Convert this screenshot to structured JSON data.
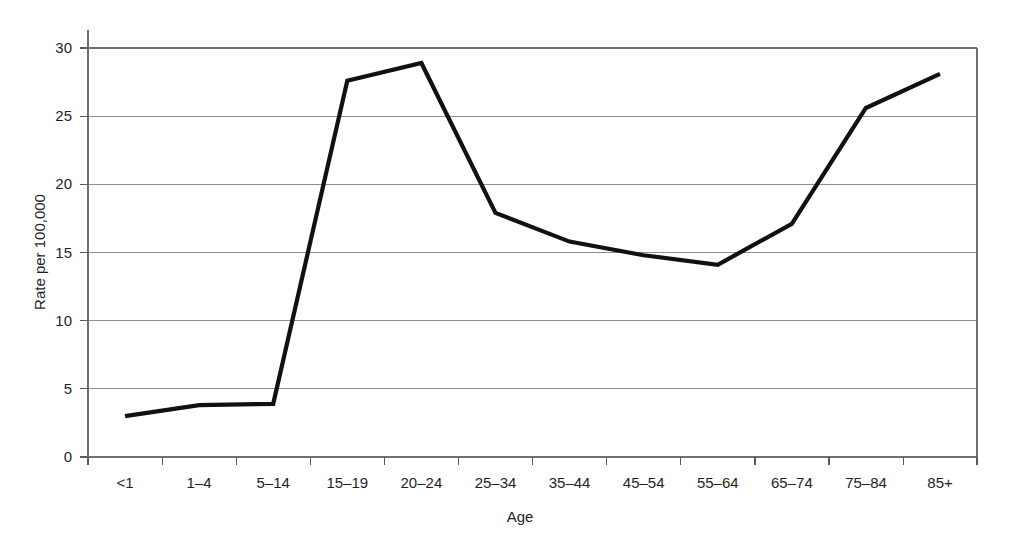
{
  "chart_data": {
    "type": "line",
    "title": "",
    "subtitle": "",
    "xlabel": "Age",
    "ylabel": "Rate per 100,000",
    "categories": [
      "<1",
      "1–4",
      "5–14",
      "15–19",
      "20–24",
      "25–34",
      "35–44",
      "45–54",
      "55–64",
      "65–74",
      "75–84",
      "85+"
    ],
    "values": [
      3.0,
      3.8,
      3.9,
      27.6,
      28.9,
      17.9,
      15.8,
      14.8,
      14.1,
      17.1,
      25.6,
      28.1
    ],
    "series": [
      {
        "name": "Rate per 100,000",
        "values": [
          3.0,
          3.8,
          3.9,
          27.6,
          28.9,
          17.9,
          15.8,
          14.8,
          14.1,
          17.1,
          25.6,
          28.1
        ]
      }
    ],
    "ylim": [
      0,
      30
    ],
    "yticks": [
      0,
      5,
      10,
      15,
      20,
      25,
      30
    ],
    "ytick_labels": [
      "0",
      "5",
      "10",
      "15",
      "20",
      "25",
      "30"
    ],
    "grid": true,
    "grid_axis": "y",
    "legend": false,
    "legend_position": "none",
    "line_color": "#111111",
    "grid_color": "#8f8f8f",
    "background_color": "#ffffff"
  }
}
